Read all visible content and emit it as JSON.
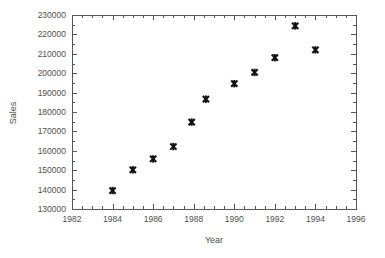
{
  "chart_data": {
    "type": "scatter",
    "title": "",
    "xlabel": "Year",
    "ylabel": "Sales",
    "xlim": [
      1982,
      1996
    ],
    "ylim": [
      130000,
      230000
    ],
    "xticks": [
      1982,
      1984,
      1986,
      1988,
      1990,
      1992,
      1994,
      1996
    ],
    "xtick_labels": [
      "1982",
      "1984",
      "1986",
      "1988",
      "1990",
      "1992",
      "1994",
      "1996"
    ],
    "x_minor_tick_step": 0.5,
    "yticks": [
      130000,
      140000,
      150000,
      160000,
      170000,
      180000,
      190000,
      200000,
      210000,
      220000,
      230000
    ],
    "ytick_labels": [
      "130000",
      "140000",
      "150000",
      "160000",
      "170000",
      "180000",
      "190000",
      "200000",
      "210000",
      "220000",
      "230000"
    ],
    "y_minor_tick_step": 5000,
    "grid": false,
    "legend": false,
    "marker_symbol": "bold-cross",
    "marker_color": "#111111",
    "frame": "box",
    "x": [
      1984.0,
      1985.0,
      1986.0,
      1987.0,
      1987.9,
      1988.6,
      1990.0,
      1991.0,
      1992.0,
      1993.0,
      1994.0
    ],
    "y": [
      139500,
      150200,
      155800,
      162200,
      174800,
      186600,
      194600,
      200400,
      208000,
      224400,
      212000
    ],
    "points": [
      {
        "x": 1984.0,
        "y": 139500
      },
      {
        "x": 1985.0,
        "y": 150200
      },
      {
        "x": 1986.0,
        "y": 155800
      },
      {
        "x": 1987.0,
        "y": 162200
      },
      {
        "x": 1987.9,
        "y": 174800
      },
      {
        "x": 1988.6,
        "y": 186600
      },
      {
        "x": 1990.0,
        "y": 194600
      },
      {
        "x": 1991.0,
        "y": 200400
      },
      {
        "x": 1992.0,
        "y": 208000
      },
      {
        "x": 1993.0,
        "y": 224400
      },
      {
        "x": 1994.0,
        "y": 212000
      }
    ]
  },
  "axes": {
    "x_title": "Year",
    "y_title": "Sales"
  }
}
